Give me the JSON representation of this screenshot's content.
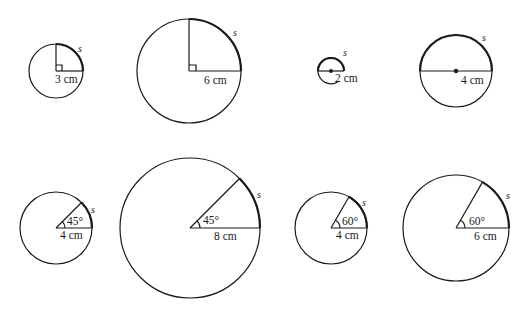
{
  "figure": {
    "circles": [
      {
        "id": "c1",
        "measure_type": "radius",
        "measure": "3 cm",
        "angle": "90°",
        "angle_marker": "right-angle",
        "arc_label": "s"
      },
      {
        "id": "c2",
        "measure_type": "radius",
        "measure": "6 cm",
        "angle": "90°",
        "angle_marker": "right-angle",
        "arc_label": "s"
      },
      {
        "id": "c3",
        "measure_type": "diameter",
        "measure": "2 cm",
        "angle": "",
        "angle_marker": "center-dot",
        "arc_label": "s"
      },
      {
        "id": "c4",
        "measure_type": "diameter",
        "measure": "4 cm",
        "angle": "",
        "angle_marker": "center-dot",
        "arc_label": "s"
      },
      {
        "id": "c5",
        "measure_type": "radius",
        "measure": "4 cm",
        "angle": "45°",
        "angle_marker": "arc",
        "arc_label": "s"
      },
      {
        "id": "c6",
        "measure_type": "radius",
        "measure": "8 cm",
        "angle": "45°",
        "angle_marker": "arc",
        "arc_label": "s"
      },
      {
        "id": "c7",
        "measure_type": "radius",
        "measure": "4 cm",
        "angle": "60°",
        "angle_marker": "arc",
        "arc_label": "s"
      },
      {
        "id": "c8",
        "measure_type": "radius",
        "measure": "6 cm",
        "angle": "60°",
        "angle_marker": "arc",
        "arc_label": "s"
      }
    ]
  }
}
